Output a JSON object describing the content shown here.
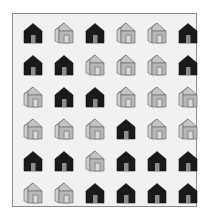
{
  "colors": {
    "background": "#ffffff",
    "panel": "#f1f1f1",
    "border": "#8a8a8a",
    "dark_house": "#1a1a1a",
    "dark_door": "#8c8c8c",
    "light_front": "#b8b8b8",
    "light_side": "#cfcfcf",
    "light_roof": "#c4c4c4",
    "light_outline": "#6e6e6e"
  },
  "grid": {
    "rows": 6,
    "cols": 6,
    "cells": [
      [
        "dark",
        "light",
        "dark",
        "light",
        "light",
        "dark"
      ],
      [
        "dark",
        "dark",
        "light",
        "light",
        "light",
        "dark"
      ],
      [
        "light",
        "dark",
        "dark",
        "light",
        "light",
        "light"
      ],
      [
        "light",
        "light",
        "light",
        "dark",
        "light",
        "light"
      ],
      [
        "dark",
        "dark",
        "light",
        "dark",
        "dark",
        "dark"
      ],
      [
        "light",
        "light",
        "dark",
        "dark",
        "dark",
        "dark"
      ]
    ]
  },
  "icons": {
    "dark": "house-filled-icon",
    "light": "house-outline-icon"
  }
}
